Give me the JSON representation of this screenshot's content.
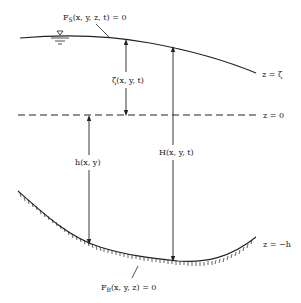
{
  "diagram": {
    "type": "water-column-coordinate-schematic",
    "colors": {
      "ink": "#222222",
      "background": "#ffffff"
    },
    "surfaces": {
      "free_surface": {
        "label": "z = ζ",
        "equation_main": "F",
        "equation_sub": "S",
        "equation_rest": "(x, y, z, t) = 0"
      },
      "datum": {
        "label": "z = 0",
        "style": "dashed"
      },
      "bottom": {
        "label": "z = −h",
        "equation_main": "F",
        "equation_sub": "B",
        "equation_rest": "(x, y, z) = 0"
      }
    },
    "dimensions": {
      "zeta": {
        "label": "ζ(x, y, t)"
      },
      "depth": {
        "label": "h(x, y)"
      },
      "total_depth": {
        "label": "H(x, y, t)"
      }
    },
    "symbols": {
      "water_level": "▽"
    }
  }
}
